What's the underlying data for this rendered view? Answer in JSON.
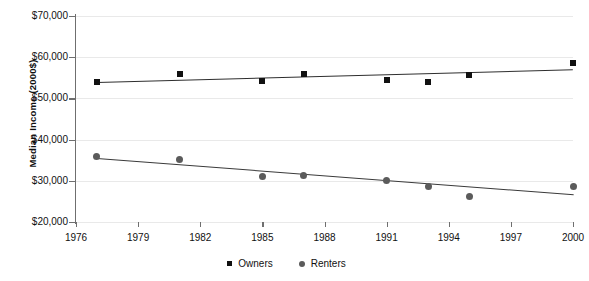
{
  "chart_data": {
    "type": "scatter",
    "title": "",
    "xlabel": "",
    "ylabel": "Median Income (2000$)",
    "xlim": [
      1976,
      2000
    ],
    "ylim": [
      20000,
      70000
    ],
    "grid": true,
    "legend_position": "bottom",
    "ytick_labels": [
      "$70,000",
      "$60,000",
      "$50,000",
      "$40,000",
      "$30,000",
      "$20,000"
    ],
    "ytick_values": [
      70000,
      60000,
      50000,
      40000,
      30000,
      20000
    ],
    "xtick_labels": [
      "1976",
      "1979",
      "1982",
      "1985",
      "1988",
      "1991",
      "1994",
      "1997",
      "2000"
    ],
    "xtick_values": [
      1976,
      1979,
      1982,
      1985,
      1988,
      1991,
      1994,
      1997,
      2000
    ],
    "series": [
      {
        "name": "Owners",
        "marker": "square",
        "color": "#111111",
        "x": [
          1977,
          1981,
          1985,
          1987,
          1991,
          1993,
          1995,
          2000
        ],
        "values": [
          54000,
          56000,
          54300,
          55900,
          54400,
          54000,
          55600,
          58500
        ],
        "trendline": {
          "x_start": 1977,
          "y_start": 54100,
          "x_end": 2000,
          "y_end": 57200
        }
      },
      {
        "name": "Renters",
        "marker": "circle",
        "color": "#5b5b5b",
        "x": [
          1977,
          1981,
          1985,
          1987,
          1991,
          1993,
          1995,
          2000
        ],
        "values": [
          36000,
          35100,
          31000,
          31200,
          30100,
          28700,
          26300,
          28600
        ],
        "trendline": {
          "x_start": 1977,
          "y_start": 35600,
          "x_end": 2000,
          "y_end": 26800
        }
      }
    ]
  },
  "legend": {
    "items": [
      {
        "label": "Owners"
      },
      {
        "label": "Renters"
      }
    ]
  },
  "axis_title": {
    "y": "Median Income (2000$)"
  }
}
